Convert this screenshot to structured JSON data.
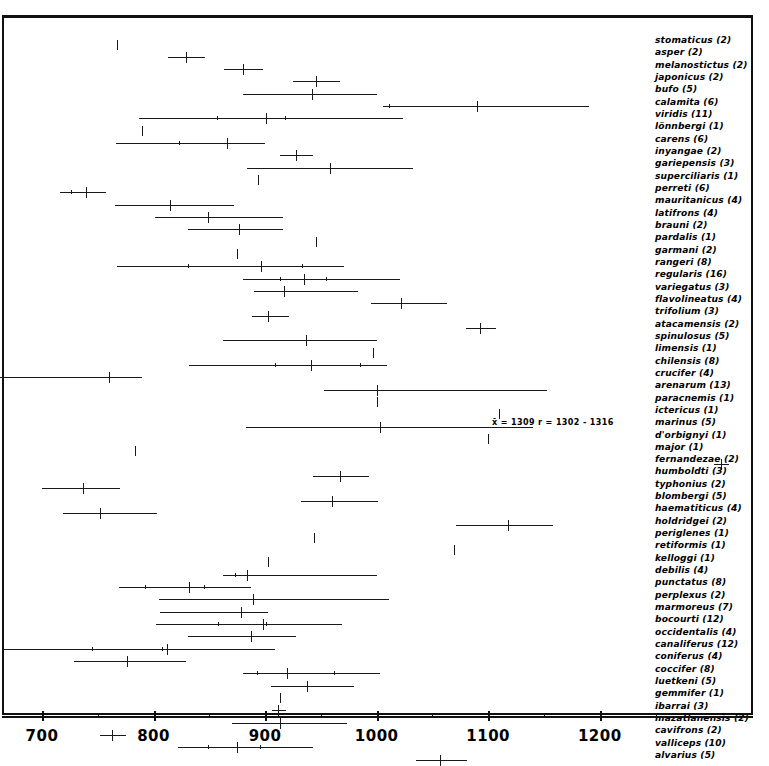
{
  "figure": {
    "caption_absent": true,
    "ink_color": "#1a1a1a",
    "background": "#ffffff"
  },
  "annotation": {
    "text": "x̄ = 1309   r = 1302 - 1316",
    "x_px": 492,
    "y_px": 418
  },
  "axis": {
    "tick_labels": [
      "700",
      "800",
      "900",
      "1000",
      "1100",
      "1200"
    ],
    "tick_values": [
      700,
      800,
      900,
      1000,
      1100,
      1200
    ],
    "minor_tick_values": [
      750,
      850,
      950,
      1050,
      1150,
      1250
    ],
    "label": ""
  },
  "chart_data": {
    "type": "range",
    "title": "",
    "xlabel": "",
    "ylabel": "",
    "xlim": [
      662,
      1335
    ],
    "grid": false,
    "legend": "none",
    "note": "Horizontal range bars with vertical tick marking the mean for each taxon; trailing number in each label is the sample size (n).",
    "columns": [
      "taxon",
      "n",
      "mean",
      "range_min",
      "range_max",
      "sub_ticks"
    ],
    "rows": [
      {
        "taxon": "stomaticus (2)",
        "n": 2,
        "mean": 767,
        "range_min": 767,
        "range_max": 767,
        "sub_ticks": []
      },
      {
        "taxon": "asper (2)",
        "n": 2,
        "mean": 829,
        "range_min": 813,
        "range_max": 846,
        "sub_ticks": []
      },
      {
        "taxon": "melanostictus (2)",
        "n": 2,
        "mean": 880,
        "range_min": 863,
        "range_max": 898,
        "sub_ticks": []
      },
      {
        "taxon": "japonicus (2)",
        "n": 2,
        "mean": 946,
        "range_min": 925,
        "range_max": 967,
        "sub_ticks": []
      },
      {
        "taxon": "bufo (5)",
        "n": 5,
        "mean": 942,
        "range_min": 880,
        "range_max": 1000,
        "sub_ticks": []
      },
      {
        "taxon": "calamita (6)",
        "n": 6,
        "mean": 1090,
        "range_min": 1006,
        "range_max": 1190,
        "sub_ticks": [
          1011
        ]
      },
      {
        "taxon": "viridis (11)",
        "n": 11,
        "mean": 901,
        "range_min": 787,
        "range_max": 1024,
        "sub_ticks": [
          857,
          918
        ]
      },
      {
        "taxon": "lönnbergi (1)",
        "n": 1,
        "mean": 790,
        "range_min": 790,
        "range_max": 790,
        "sub_ticks": []
      },
      {
        "taxon": "carens (6)",
        "n": 6,
        "mean": 866,
        "range_min": 766,
        "range_max": 900,
        "sub_ticks": [
          823
        ]
      },
      {
        "taxon": "inyangae (2)",
        "n": 2,
        "mean": 928,
        "range_min": 913,
        "range_max": 943,
        "sub_ticks": []
      },
      {
        "taxon": "gariepensis (3)",
        "n": 3,
        "mean": 958,
        "range_min": 884,
        "range_max": 1033,
        "sub_ticks": []
      },
      {
        "taxon": "superciliaris (1)",
        "n": 1,
        "mean": 894,
        "range_min": 894,
        "range_max": 894,
        "sub_ticks": []
      },
      {
        "taxon": "perreti (6)",
        "n": 6,
        "mean": 739,
        "range_min": 716,
        "range_max": 757,
        "sub_ticks": [
          726
        ]
      },
      {
        "taxon": "mauritanicus (4)",
        "n": 4,
        "mean": 815,
        "range_min": 765,
        "range_max": 872,
        "sub_ticks": []
      },
      {
        "taxon": "latifrons (4)",
        "n": 4,
        "mean": 849,
        "range_min": 801,
        "range_max": 916,
        "sub_ticks": []
      },
      {
        "taxon": "brauni (2)",
        "n": 2,
        "mean": 877,
        "range_min": 831,
        "range_max": 916,
        "sub_ticks": []
      },
      {
        "taxon": "pardalis (1)",
        "n": 1,
        "mean": 946,
        "range_min": 946,
        "range_max": 946,
        "sub_ticks": []
      },
      {
        "taxon": "garmani (2)",
        "n": 2,
        "mean": 875,
        "range_min": 875,
        "range_max": 875,
        "sub_ticks": []
      },
      {
        "taxon": "rangeri (8)",
        "n": 8,
        "mean": 896,
        "range_min": 767,
        "range_max": 971,
        "sub_ticks": [
          831,
          933
        ]
      },
      {
        "taxon": "regularis (16)",
        "n": 16,
        "mean": 935,
        "range_min": 880,
        "range_max": 1021,
        "sub_ticks": [
          913,
          955
        ]
      },
      {
        "taxon": "variegatus (3)",
        "n": 3,
        "mean": 917,
        "range_min": 890,
        "range_max": 983,
        "sub_ticks": []
      },
      {
        "taxon": "flavolineatus (4)",
        "n": 4,
        "mean": 1022,
        "range_min": 995,
        "range_max": 1063,
        "sub_ticks": []
      },
      {
        "taxon": "trifolium (3)",
        "n": 3,
        "mean": 903,
        "range_min": 888,
        "range_max": 921,
        "sub_ticks": []
      },
      {
        "taxon": "atacamensis (2)",
        "n": 2,
        "mean": 1093,
        "range_min": 1080,
        "range_max": 1107,
        "sub_ticks": []
      },
      {
        "taxon": "spinulosus (5)",
        "n": 5,
        "mean": 937,
        "range_min": 862,
        "range_max": 1000,
        "sub_ticks": []
      },
      {
        "taxon": "limensis (1)",
        "n": 1,
        "mean": 997,
        "range_min": 997,
        "range_max": 997,
        "sub_ticks": []
      },
      {
        "taxon": "chilensis (8)",
        "n": 8,
        "mean": 941,
        "range_min": 832,
        "range_max": 1009,
        "sub_ticks": [
          909,
          985
        ]
      },
      {
        "taxon": "crucifer (4)",
        "n": 4,
        "mean": 760,
        "range_min": 662,
        "range_max": 790,
        "sub_ticks": []
      },
      {
        "taxon": "arenarum (13)",
        "n": 13,
        "mean": 1000,
        "range_min": 953,
        "range_max": 1153,
        "sub_ticks": []
      },
      {
        "taxon": "paracnemis (1)",
        "n": 1,
        "mean": 1000,
        "range_min": 1000,
        "range_max": 1000,
        "sub_ticks": []
      },
      {
        "taxon": "ictericus (1)",
        "n": 1,
        "mean": 1110,
        "range_min": 1110,
        "range_max": 1110,
        "sub_ticks": []
      },
      {
        "taxon": "marinus (5)",
        "n": 5,
        "mean": 1003,
        "range_min": 883,
        "range_max": 1140,
        "sub_ticks": []
      },
      {
        "taxon": "d'orbignyi (1)",
        "n": 1,
        "mean": 1100,
        "range_min": 1100,
        "range_max": 1100,
        "sub_ticks": []
      },
      {
        "taxon": "major (1)",
        "n": 1,
        "mean": 783,
        "range_min": 783,
        "range_max": 783,
        "sub_ticks": []
      },
      {
        "taxon": "fernandezae (2)",
        "n": 2,
        "mean": 1309,
        "range_min": 1302,
        "range_max": 1316,
        "sub_ticks": []
      },
      {
        "taxon": "humboldti (3)",
        "n": 3,
        "mean": 967,
        "range_min": 943,
        "range_max": 993,
        "sub_ticks": []
      },
      {
        "taxon": "typhonius (2)",
        "n": 2,
        "mean": 737,
        "range_min": 700,
        "range_max": 770,
        "sub_ticks": []
      },
      {
        "taxon": "blombergi (5)",
        "n": 5,
        "mean": 960,
        "range_min": 932,
        "range_max": 1001,
        "sub_ticks": []
      },
      {
        "taxon": "haematiticus (4)",
        "n": 4,
        "mean": 752,
        "range_min": 719,
        "range_max": 803,
        "sub_ticks": []
      },
      {
        "taxon": "holdridgei (2)",
        "n": 2,
        "mean": 1118,
        "range_min": 1071,
        "range_max": 1158,
        "sub_ticks": []
      },
      {
        "taxon": "periglenes (1)",
        "n": 1,
        "mean": 944,
        "range_min": 944,
        "range_max": 944,
        "sub_ticks": []
      },
      {
        "taxon": "retiformis (1)",
        "n": 1,
        "mean": 1069,
        "range_min": 1069,
        "range_max": 1069,
        "sub_ticks": []
      },
      {
        "taxon": "kelloggi (1)",
        "n": 1,
        "mean": 903,
        "range_min": 903,
        "range_max": 903,
        "sub_ticks": []
      },
      {
        "taxon": "debilis (4)",
        "n": 4,
        "mean": 884,
        "range_min": 862,
        "range_max": 1000,
        "sub_ticks": [
          873
        ]
      },
      {
        "taxon": "punctatus (8)",
        "n": 8,
        "mean": 832,
        "range_min": 769,
        "range_max": 887,
        "sub_ticks": [
          792,
          845
        ]
      },
      {
        "taxon": "perplexus (2)",
        "n": 2,
        "mean": 889,
        "range_min": 805,
        "range_max": 1011,
        "sub_ticks": []
      },
      {
        "taxon": "marmoreus (7)",
        "n": 7,
        "mean": 878,
        "range_min": 806,
        "range_max": 903,
        "sub_ticks": []
      },
      {
        "taxon": "bocourti (12)",
        "n": 12,
        "mean": 898,
        "range_min": 802,
        "range_max": 969,
        "sub_ticks": [
          858,
          901
        ]
      },
      {
        "taxon": "occidentalis (4)",
        "n": 4,
        "mean": 887,
        "range_min": 831,
        "range_max": 928,
        "sub_ticks": []
      },
      {
        "taxon": "canaliferus (12)",
        "n": 12,
        "mean": 812,
        "range_min": 666,
        "range_max": 909,
        "sub_ticks": [
          745,
          808
        ]
      },
      {
        "taxon": "coniferus (4)",
        "n": 4,
        "mean": 776,
        "range_min": 729,
        "range_max": 829,
        "sub_ticks": []
      },
      {
        "taxon": "coccifer (8)",
        "n": 8,
        "mean": 920,
        "range_min": 880,
        "range_max": 1003,
        "sub_ticks": [
          893,
          962
        ]
      },
      {
        "taxon": "luetkeni (5)",
        "n": 5,
        "mean": 938,
        "range_min": 905,
        "range_max": 980,
        "sub_ticks": []
      },
      {
        "taxon": "gemmifer (1)",
        "n": 1,
        "mean": 913,
        "range_min": 913,
        "range_max": 913,
        "sub_ticks": []
      },
      {
        "taxon": "ibarrai (3)",
        "n": 3,
        "mean": 912,
        "range_min": 906,
        "range_max": 919,
        "sub_ticks": []
      },
      {
        "taxon": "mazatlanensis (2)",
        "n": 2,
        "mean": 913,
        "range_min": 870,
        "range_max": 973,
        "sub_ticks": []
      },
      {
        "taxon": "cavifrons (2)",
        "n": 2,
        "mean": 763,
        "range_min": 752,
        "range_max": 775,
        "sub_ticks": []
      },
      {
        "taxon": "valliceps (10)",
        "n": 10,
        "mean": 875,
        "range_min": 822,
        "range_max": 943,
        "sub_ticks": [
          849,
          895
        ]
      },
      {
        "taxon": "alvarius (5)",
        "n": 5,
        "mean": 1057,
        "range_min": 1035,
        "range_max": 1081,
        "sub_ticks": []
      }
    ]
  }
}
